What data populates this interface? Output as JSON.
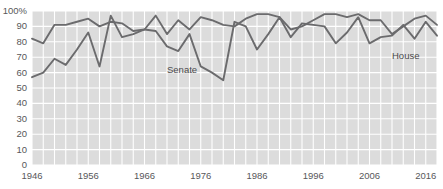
{
  "chart_data": {
    "type": "line",
    "title": "",
    "subtitle": "",
    "xlabel": "",
    "ylabel": "",
    "xlim": [
      1946,
      2018
    ],
    "ylim": [
      0,
      100
    ],
    "grid": true,
    "legend_position": "inline-labels",
    "x_tick_labels": [
      "1946",
      "1956",
      "1966",
      "1976",
      "1986",
      "1996",
      "2006",
      "2016"
    ],
    "x_tick_values": [
      1946,
      1956,
      1966,
      1976,
      1986,
      1996,
      2006,
      2016
    ],
    "y_tick_labels": [
      "100%",
      "90",
      "80",
      "70",
      "60",
      "50",
      "40",
      "30",
      "20",
      "10",
      "0"
    ],
    "y_tick_values": [
      100,
      90,
      80,
      70,
      60,
      50,
      40,
      30,
      20,
      10,
      0
    ],
    "x": [
      1946,
      1948,
      1950,
      1952,
      1954,
      1956,
      1958,
      1960,
      1962,
      1964,
      1966,
      1968,
      1970,
      1972,
      1974,
      1976,
      1978,
      1980,
      1982,
      1984,
      1986,
      1988,
      1990,
      1992,
      1994,
      1996,
      1998,
      2000,
      2002,
      2004,
      2006,
      2008,
      2010,
      2012,
      2014,
      2016,
      2018
    ],
    "series": [
      {
        "name": "House",
        "color": "#6b6b6d",
        "values": [
          82,
          79,
          91,
          91,
          93,
          95,
          90,
          93,
          92,
          87,
          88,
          97,
          85,
          94,
          88,
          96,
          94,
          91,
          90,
          95,
          98,
          98,
          96,
          88,
          90,
          94,
          98,
          98,
          96,
          98,
          94,
          94,
          85,
          90,
          95,
          97,
          91
        ]
      },
      {
        "name": "Senate",
        "color": "#6b6b6d",
        "values": [
          57,
          60,
          69,
          65,
          75,
          86,
          64,
          97,
          83,
          85,
          88,
          87,
          77,
          74,
          85,
          64,
          60,
          55,
          93,
          90,
          75,
          85,
          96,
          83,
          92,
          91,
          90,
          79,
          86,
          96,
          79,
          83,
          84,
          91,
          82,
          93,
          84
        ]
      }
    ],
    "annotations": [
      {
        "text": "Senate",
        "x_value": 1970,
        "y_value": 62
      },
      {
        "text": "House",
        "x_value": 2010,
        "y_value": 71
      }
    ],
    "colors": {
      "plot_background": "#dcdcdc",
      "gridline": "#ffffff",
      "line": "#6b6b6d",
      "axis_text": "#58585a",
      "page_background": "#ffffff"
    }
  }
}
